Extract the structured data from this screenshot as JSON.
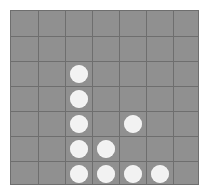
{
  "board": {
    "name": "grid-game-board",
    "columns": 7,
    "rows": 7,
    "cell_width": 27,
    "cell_height": 25,
    "origin_x": 10,
    "origin_y": 10,
    "piece_diameter": 18,
    "colors": {
      "board_background": "#909090",
      "grid_line": "#6e6e6e",
      "board_border": "#6e6e6e",
      "piece_fill": "#f2f2f2",
      "page_background": "#ffffff"
    }
  },
  "pieces": [
    {
      "label": "piece-c3-r3",
      "col": 3,
      "row": 3,
      "color": "#f2f2f2"
    },
    {
      "label": "piece-c3-r4",
      "col": 3,
      "row": 4,
      "color": "#f2f2f2"
    },
    {
      "label": "piece-c3-r5",
      "col": 3,
      "row": 5,
      "color": "#f2f2f2"
    },
    {
      "label": "piece-c3-r6",
      "col": 3,
      "row": 6,
      "color": "#f2f2f2"
    },
    {
      "label": "piece-c3-r7",
      "col": 3,
      "row": 7,
      "color": "#f2f2f2"
    },
    {
      "label": "piece-c4-r6",
      "col": 4,
      "row": 6,
      "color": "#f2f2f2"
    },
    {
      "label": "piece-c4-r7",
      "col": 4,
      "row": 7,
      "color": "#f2f2f2"
    },
    {
      "label": "piece-c5-r5",
      "col": 5,
      "row": 5,
      "color": "#f2f2f2"
    },
    {
      "label": "piece-c5-r7",
      "col": 5,
      "row": 7,
      "color": "#f2f2f2"
    },
    {
      "label": "piece-c6-r7",
      "col": 6,
      "row": 7,
      "color": "#f2f2f2"
    }
  ]
}
